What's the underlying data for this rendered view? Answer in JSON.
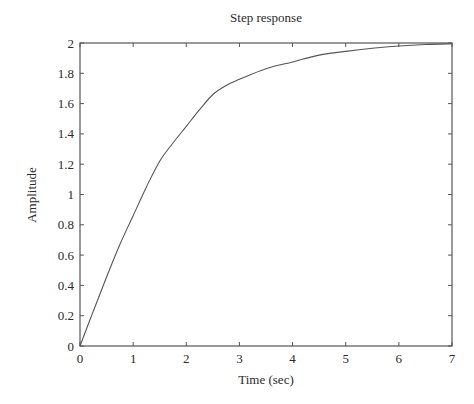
{
  "chart_data": {
    "type": "line",
    "title": "Step response",
    "xlabel": "Time (sec)",
    "ylabel": "Amplitude",
    "xlim": [
      0,
      7
    ],
    "ylim": [
      0,
      2
    ],
    "xticks": [
      0,
      1,
      2,
      3,
      4,
      5,
      6,
      7
    ],
    "xtick_labels": [
      "0",
      "1",
      "2",
      "3",
      "4",
      "5",
      "6",
      "7"
    ],
    "yticks": [
      0,
      0.2,
      0.4,
      0.6,
      0.8,
      1.0,
      1.2,
      1.4,
      1.6,
      1.8,
      2.0
    ],
    "ytick_labels": [
      "0",
      "0.2",
      "0.4",
      "0.6",
      "0.8",
      "1",
      "1.2",
      "1.4",
      "1.6",
      "1.8",
      "2"
    ],
    "grid": false,
    "legend": null,
    "series": [
      {
        "name": "step response",
        "color": "#555555",
        "x": [
          0,
          0.25,
          0.5,
          0.75,
          1.0,
          1.25,
          1.5,
          1.75,
          2.0,
          2.25,
          2.5,
          2.75,
          3.0,
          3.5,
          4.0,
          4.5,
          5.0,
          5.5,
          6.0,
          6.5,
          7.0
        ],
        "y": [
          0,
          0.23,
          0.455,
          0.67,
          0.86,
          1.05,
          1.22,
          1.34,
          1.45,
          1.56,
          1.66,
          1.72,
          1.76,
          1.83,
          1.875,
          1.92,
          1.945,
          1.965,
          1.98,
          1.99,
          1.995
        ]
      }
    ]
  },
  "plot_area": {
    "left": 80,
    "top": 43,
    "right": 452,
    "bottom": 346
  },
  "colors": {
    "axes": "#555555",
    "line": "#555555",
    "text": "#2a2a2a"
  }
}
